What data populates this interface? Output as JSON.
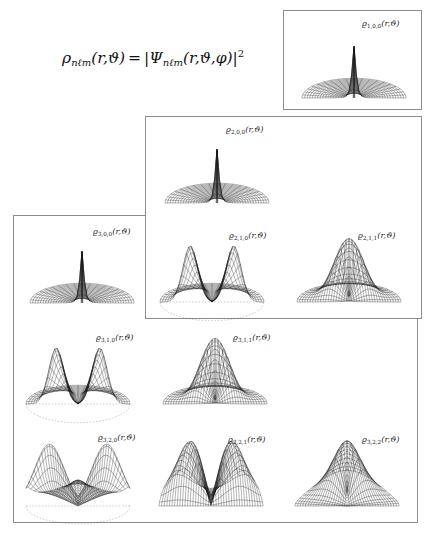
{
  "figure": {
    "title_formula": {
      "lhs_symbol": "ρ",
      "lhs_sub": "nℓm",
      "lhs_args": "(r,ϑ)",
      "equals": "=",
      "rhs_symbol": "Ψ",
      "rhs_sub": "nℓm",
      "rhs_args": "(r,ϑ,φ)",
      "exponent": "2",
      "plain": "ρnℓm(r,ϑ) = |Ψnℓm(r,ϑ,φ)|²"
    },
    "background_color": "#ffffff",
    "line_color": "#1a1a1a",
    "box_border_color": "#8c8c8c"
  },
  "groups": [
    {
      "name": "n=1 shell box",
      "label": "box-n1"
    },
    {
      "name": "n=2 shell box",
      "label": "box-n2"
    },
    {
      "name": "n=3 shell box",
      "label": "box-n3"
    }
  ],
  "panels": [
    {
      "id": "p100",
      "rho": "ϱ",
      "sub": "1,0,0",
      "args": "(r,ϑ)",
      "plain": "ϱ1,0,0(r,ϑ)",
      "n": 1,
      "l": 0,
      "m": 0,
      "surface": "polar-dome-with-central-spike",
      "lobes": 1,
      "baseline_dashed": false
    },
    {
      "id": "p200",
      "rho": "ϱ",
      "sub": "2,0,0",
      "args": "(r,ϑ)",
      "plain": "ϱ2,0,0(r,ϑ)",
      "n": 2,
      "l": 0,
      "m": 0,
      "surface": "polar-dome-with-central-spike",
      "lobes": 1,
      "baseline_dashed": false
    },
    {
      "id": "p210",
      "rho": "ϱ",
      "sub": "2,1,0",
      "args": "(r,ϑ)",
      "plain": "ϱ2,1,0(r,ϑ)",
      "n": 2,
      "l": 1,
      "m": 0,
      "surface": "two-vertical-lobes-with-nodal-plane",
      "lobes": 2,
      "baseline_dashed": true
    },
    {
      "id": "p211",
      "rho": "ϱ",
      "sub": "2,1,1",
      "args": "(r,ϑ)",
      "plain": "ϱ2,1,1(r,ϑ)",
      "n": 2,
      "l": 1,
      "m": 1,
      "surface": "single-central-peak-on-torus",
      "lobes": 1,
      "baseline_dashed": false
    },
    {
      "id": "p300",
      "rho": "ϱ",
      "sub": "3,0,0",
      "args": "(r,ϑ)",
      "plain": "ϱ3,0,0(r,ϑ)",
      "n": 3,
      "l": 0,
      "m": 0,
      "surface": "polar-dome-with-central-spike",
      "lobes": 1,
      "baseline_dashed": false
    },
    {
      "id": "p310",
      "rho": "ϱ",
      "sub": "3,1,0",
      "args": "(r,ϑ)",
      "plain": "ϱ3,1,0(r,ϑ)",
      "n": 3,
      "l": 1,
      "m": 0,
      "surface": "two-vertical-lobes-with-nodal-plane",
      "lobes": 2,
      "baseline_dashed": true
    },
    {
      "id": "p311",
      "rho": "ϱ",
      "sub": "3,1,1",
      "args": "(r,ϑ)",
      "plain": "ϱ3,1,1(r,ϑ)",
      "n": 3,
      "l": 1,
      "m": 1,
      "surface": "single-central-peak-on-dome",
      "lobes": 1,
      "baseline_dashed": false
    },
    {
      "id": "p320",
      "rho": "ϱ",
      "sub": "3,2,0",
      "args": "(r,ϑ)",
      "plain": "ϱ3,2,0(r,ϑ)",
      "n": 3,
      "l": 2,
      "m": 0,
      "surface": "two-broad-lobes-with-deep-nodal-valley",
      "lobes": 2,
      "baseline_dashed": true
    },
    {
      "id": "p321",
      "rho": "ϱ",
      "sub": "3,2,1",
      "args": "(r,ϑ)",
      "plain": "ϱ3,2,1(r,ϑ)",
      "n": 3,
      "l": 2,
      "m": 1,
      "surface": "two-broad-lobes-with-shallow-valley",
      "lobes": 2,
      "baseline_dashed": false
    },
    {
      "id": "p322",
      "rho": "ϱ",
      "sub": "3,2,2",
      "args": "(r,ϑ)",
      "plain": "ϱ3,2,2(r,ϑ)",
      "n": 3,
      "l": 2,
      "m": 2,
      "surface": "single-broad-peak-on-dome",
      "lobes": 1,
      "baseline_dashed": false
    }
  ]
}
